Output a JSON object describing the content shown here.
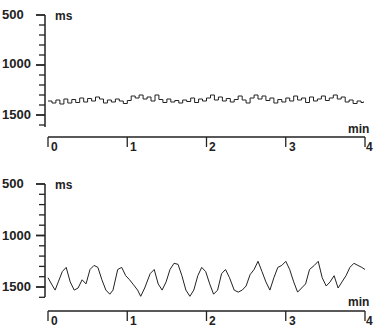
{
  "chart_data": [
    {
      "type": "line",
      "title": "",
      "ylabel": "ms",
      "xlabel": "min",
      "ylim": [
        500,
        1600
      ],
      "y_inverted": true,
      "xlim": [
        0,
        4
      ],
      "yticks": [
        500,
        1000,
        1500
      ],
      "ytick_labels": [
        "500",
        "1000",
        "1500"
      ],
      "xticks": [
        0,
        1,
        2,
        3,
        4
      ],
      "xtick_labels": [
        "0",
        "1",
        "2",
        "3",
        "4"
      ],
      "grid": false,
      "legend": null,
      "series": [
        {
          "name": "upper trace (low variability)",
          "x": [
            0.0,
            0.05,
            0.1,
            0.15,
            0.2,
            0.25,
            0.3,
            0.35,
            0.4,
            0.45,
            0.5,
            0.55,
            0.6,
            0.65,
            0.7,
            0.75,
            0.8,
            0.85,
            0.9,
            0.95,
            1.0,
            1.05,
            1.1,
            1.15,
            1.2,
            1.25,
            1.3,
            1.35,
            1.4,
            1.45,
            1.5,
            1.55,
            1.6,
            1.65,
            1.7,
            1.75,
            1.8,
            1.85,
            1.9,
            1.95,
            2.0,
            2.05,
            2.1,
            2.15,
            2.2,
            2.25,
            2.3,
            2.35,
            2.4,
            2.45,
            2.5,
            2.55,
            2.6,
            2.65,
            2.7,
            2.75,
            2.8,
            2.85,
            2.9,
            2.95,
            3.0,
            3.05,
            3.1,
            3.15,
            3.2,
            3.25,
            3.3,
            3.35,
            3.4,
            3.45,
            3.5,
            3.55,
            3.6,
            3.65,
            3.7,
            3.75,
            3.8,
            3.85,
            3.9,
            3.95,
            3.98
          ],
          "values": [
            1360,
            1380,
            1350,
            1390,
            1340,
            1380,
            1345,
            1375,
            1330,
            1370,
            1335,
            1360,
            1320,
            1340,
            1380,
            1350,
            1370,
            1340,
            1360,
            1385,
            1355,
            1310,
            1330,
            1300,
            1340,
            1320,
            1360,
            1300,
            1345,
            1375,
            1340,
            1370,
            1355,
            1380,
            1350,
            1365,
            1330,
            1375,
            1340,
            1360,
            1330,
            1300,
            1350,
            1320,
            1360,
            1335,
            1370,
            1345,
            1310,
            1350,
            1380,
            1330,
            1300,
            1340,
            1310,
            1355,
            1330,
            1380,
            1345,
            1370,
            1330,
            1360,
            1310,
            1350,
            1330,
            1375,
            1320,
            1360,
            1340,
            1310,
            1355,
            1330,
            1300,
            1340,
            1320,
            1370,
            1350,
            1385,
            1360,
            1375,
            1365
          ]
        },
        {
          "name": "lower trace (high variability)",
          "x": [
            0.0,
            0.05,
            0.09,
            0.13,
            0.18,
            0.23,
            0.28,
            0.33,
            0.38,
            0.43,
            0.48,
            0.53,
            0.58,
            0.63,
            0.68,
            0.73,
            0.78,
            0.82,
            0.88,
            0.93,
            0.98,
            1.03,
            1.08,
            1.13,
            1.17,
            1.22,
            1.29,
            1.34,
            1.39,
            1.44,
            1.49,
            1.54,
            1.59,
            1.64,
            1.69,
            1.74,
            1.79,
            1.84,
            1.89,
            1.94,
            1.99,
            2.04,
            2.09,
            2.14,
            2.19,
            2.24,
            2.29,
            2.35,
            2.4,
            2.45,
            2.5,
            2.55,
            2.6,
            2.65,
            2.7,
            2.75,
            2.8,
            2.85,
            2.9,
            2.95,
            3.0,
            3.05,
            3.1,
            3.15,
            3.2,
            3.25,
            3.3,
            3.36,
            3.41,
            3.46,
            3.51,
            3.56,
            3.61,
            3.66,
            3.71,
            3.76,
            3.81,
            3.86,
            3.91,
            3.96,
            4.0
          ],
          "values": [
            1410,
            1480,
            1530,
            1450,
            1350,
            1310,
            1450,
            1530,
            1510,
            1430,
            1470,
            1330,
            1290,
            1310,
            1430,
            1530,
            1570,
            1530,
            1330,
            1310,
            1390,
            1430,
            1480,
            1530,
            1590,
            1510,
            1370,
            1330,
            1470,
            1530,
            1450,
            1330,
            1270,
            1280,
            1390,
            1530,
            1590,
            1530,
            1390,
            1310,
            1350,
            1470,
            1570,
            1530,
            1370,
            1330,
            1410,
            1530,
            1550,
            1530,
            1490,
            1380,
            1330,
            1250,
            1350,
            1450,
            1530,
            1410,
            1310,
            1290,
            1250,
            1330,
            1450,
            1550,
            1510,
            1470,
            1330,
            1290,
            1250,
            1410,
            1490,
            1450,
            1390,
            1510,
            1450,
            1390,
            1310,
            1270,
            1290,
            1310,
            1330
          ]
        }
      ]
    }
  ],
  "panels": [
    {
      "y_unit": "ms",
      "x_unit": "min",
      "y_labels": [
        "500",
        "1000",
        "1500"
      ],
      "x_labels": [
        "0",
        "1",
        "2",
        "3",
        "4"
      ]
    },
    {
      "y_unit": "ms",
      "x_unit": "min",
      "y_labels": [
        "500",
        "1000",
        "1500"
      ],
      "x_labels": [
        "0",
        "1",
        "2",
        "3",
        "4"
      ]
    }
  ],
  "colors": {
    "ink": "#222222",
    "background": "#ffffff"
  }
}
